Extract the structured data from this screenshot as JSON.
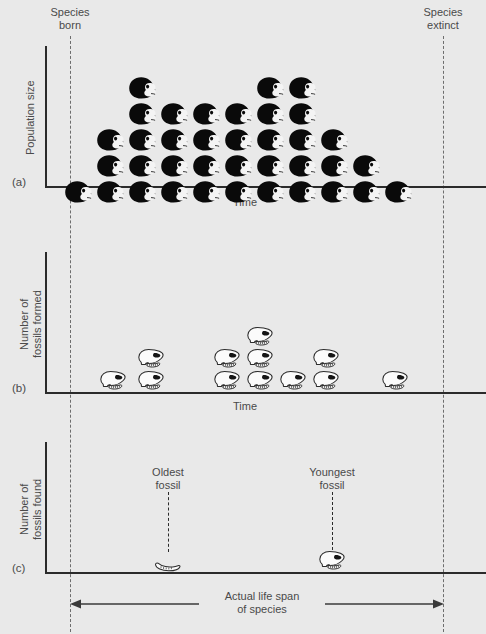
{
  "figure": {
    "background_color": "#e9e9e9",
    "ink_color": "#2b2b2b",
    "dash_color": "#6d6d6d",
    "width": 486,
    "height": 634
  },
  "markers": {
    "species_born_label": "Species\nborn",
    "species_extinct_label": "Species\nextinct",
    "born_x": 70,
    "extinct_x": 443
  },
  "panels": [
    {
      "letter": "(a)",
      "ylabel": "Population size",
      "xlabel": "Time",
      "baseline_y": 186,
      "axis_x": 45,
      "axis_top_y": 46
    },
    {
      "letter": "(b)",
      "ylabel": "Number of\nfossils formed",
      "xlabel": "Time",
      "baseline_y": 392,
      "axis_x": 45,
      "axis_top_y": 252
    },
    {
      "letter": "(c)",
      "ylabel": "Number of\nfossils found",
      "xlabel": "",
      "baseline_y": 572,
      "axis_x": 45,
      "axis_top_y": 442
    }
  ],
  "lifespan": {
    "label": "Actual life span\nof species",
    "arrow_y": 604,
    "left_x": 70,
    "right_x": 443
  },
  "callouts": [
    {
      "label": "Oldest\nfossil",
      "x": 168,
      "label_y": 466,
      "leader_top": 492,
      "leader_bottom": 552
    },
    {
      "label": "Youngest\nfossil",
      "x": 332,
      "label_y": 466,
      "leader_top": 492,
      "leader_bottom": 550
    }
  ],
  "chart_data": [
    {
      "type": "bar",
      "panel": "a",
      "title": "Population size over time",
      "xlabel": "Time",
      "ylabel": "Population size",
      "unit": "living individual (black head icon)",
      "categories": [
        "t1",
        "t2",
        "t3",
        "t4",
        "t5",
        "t6",
        "t7",
        "t8",
        "t9",
        "t10",
        "t11"
      ],
      "values": [
        1,
        3,
        5,
        4,
        4,
        4,
        5,
        5,
        3,
        2,
        1
      ],
      "column_x": [
        78,
        110,
        142,
        174,
        206,
        238,
        270,
        302,
        334,
        366,
        398
      ],
      "row_y": [
        168,
        142,
        116,
        90,
        64
      ],
      "grid": false,
      "notes": "Pyramid of solid black primate heads; bottom row 11 icons, then 9, 8, 5, 3 going up."
    },
    {
      "type": "bar",
      "panel": "b",
      "title": "Number of fossils formed over time",
      "xlabel": "Time",
      "ylabel": "Number of fossils formed",
      "unit": "fossil skull (white outlined icon)",
      "categories": [
        "t1",
        "t2",
        "t3",
        "t4",
        "t5",
        "t6",
        "t7",
        "t8",
        "t9"
      ],
      "values": [
        1,
        2,
        0,
        2,
        3,
        1,
        2,
        0,
        1
      ],
      "column_x": [
        113,
        151,
        189,
        227,
        260,
        293,
        326,
        359,
        395
      ],
      "row_y": [
        374,
        350,
        326
      ],
      "grid": false,
      "notes": "Only a small fraction of the living population becomes fossilised."
    },
    {
      "type": "bar",
      "panel": "c",
      "title": "Number of fossils found",
      "xlabel": "",
      "ylabel": "Number of fossils found",
      "unit": "fossil recovered",
      "categories": [
        "Oldest fossil",
        "Youngest fossil"
      ],
      "values": [
        1,
        1
      ],
      "column_x": [
        168,
        332
      ],
      "grid": false,
      "notes": "Only two fossils are actually discovered; they bracket a range shorter than the true life span of the species."
    }
  ]
}
